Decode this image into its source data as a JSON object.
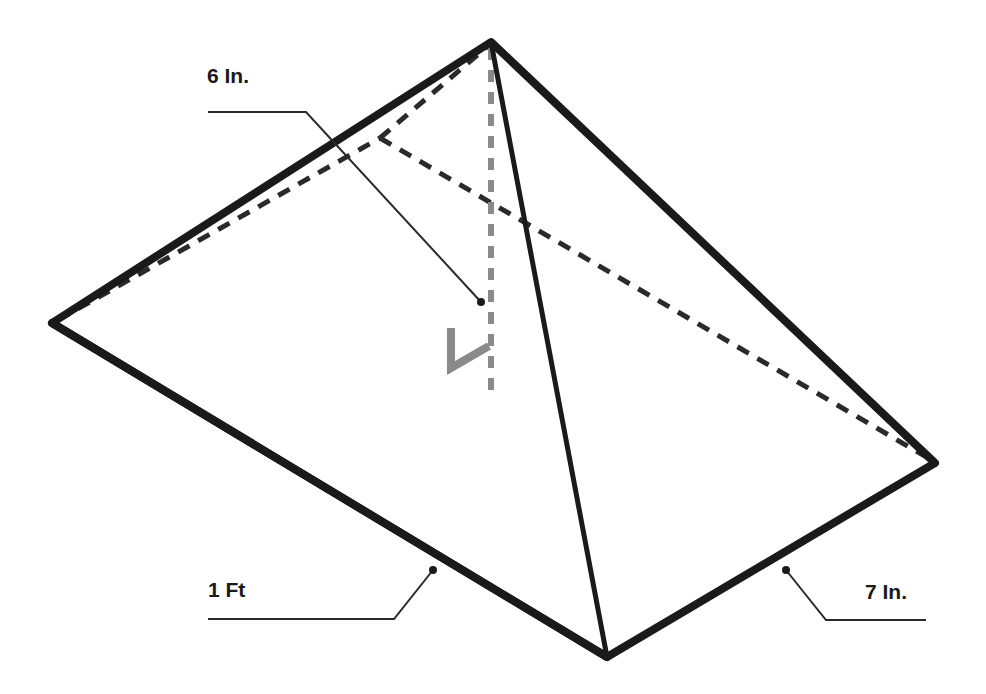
{
  "diagram": {
    "type": "rectangular pyramid",
    "labels": {
      "height": "6 In.",
      "length": "1 Ft",
      "width": "7 In."
    },
    "colors": {
      "edge": "#1a1a1a",
      "hidden_edge": "#333333",
      "height_line": "#8a8a8a",
      "right_angle_mark": "#8a8a8a",
      "background": "#ffffff"
    }
  }
}
